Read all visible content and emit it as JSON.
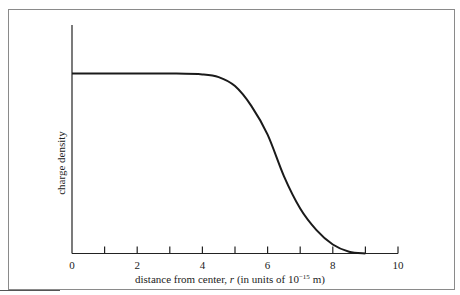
{
  "chart_data": {
    "type": "line",
    "title": "",
    "xlabel": "distance from center, r (in units of 10⁻¹⁵ m)",
    "xlabel_parts": {
      "main": "distance from center, ",
      "var": "r",
      "units_prefix": " (in units of 10",
      "exponent": "−15",
      "units_suffix": " m)"
    },
    "ylabel": "charge density",
    "xlim": [
      0,
      10
    ],
    "ylim": [
      0,
      1.25
    ],
    "x_ticks": [
      0,
      1,
      2,
      3,
      4,
      5,
      6,
      7,
      8,
      9,
      10
    ],
    "x_tick_labels": [
      "0",
      "",
      "2",
      "",
      "4",
      "",
      "6",
      "",
      "8",
      "",
      "10"
    ],
    "y_ticks": [],
    "grid": false,
    "legend": null,
    "series": [
      {
        "name": "charge density",
        "color": "#1a1a1a",
        "x": [
          0,
          1,
          2,
          3,
          4,
          4.5,
          5,
          5.5,
          6,
          6.5,
          7,
          7.5,
          8,
          8.5,
          9
        ],
        "y": [
          1.0,
          1.0,
          1.0,
          1.0,
          0.995,
          0.98,
          0.93,
          0.82,
          0.66,
          0.43,
          0.25,
          0.13,
          0.05,
          0.01,
          0.0
        ]
      }
    ]
  }
}
